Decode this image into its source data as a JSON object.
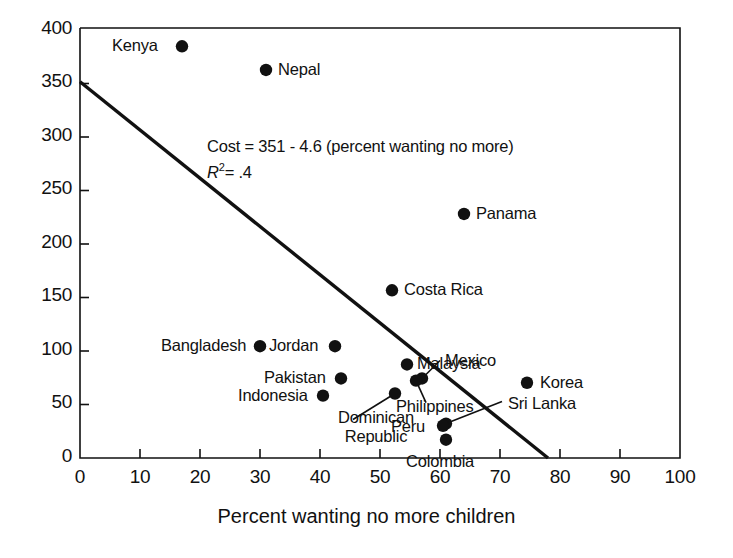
{
  "chart_data": {
    "type": "scatter",
    "title": "",
    "xlabel": "Percent wanting no more children",
    "ylabel": "",
    "xlim": [
      0,
      100
    ],
    "ylim": [
      0,
      400
    ],
    "xticks": [
      "0",
      "10",
      "20",
      "30",
      "40",
      "50",
      "60",
      "70",
      "80",
      "90",
      "100"
    ],
    "yticks": [
      "0",
      "50",
      "100",
      "150",
      "200",
      "250",
      "300",
      "350",
      "400"
    ],
    "grid": false,
    "legend": "none",
    "annotations": {
      "equation": "Cost = 351 - 4.6 (percent wanting no more)",
      "r_squared_prefix": "R",
      "r_squared_exponent": "2",
      "r_squared_value": "= .4"
    },
    "fit_line": {
      "intercept": 351,
      "slope": -4.6,
      "x_start": 0,
      "y_start": 350,
      "x_end": 78,
      "y_end": 0
    },
    "points": [
      {
        "name": "Kenya",
        "x": 17,
        "y": 383,
        "label_side": "left"
      },
      {
        "name": "Nepal",
        "x": 31,
        "y": 361,
        "label_side": "right"
      },
      {
        "name": "Panama",
        "x": 64,
        "y": 227,
        "label_side": "right"
      },
      {
        "name": "Costa Rica",
        "x": 52,
        "y": 156,
        "label_side": "right"
      },
      {
        "name": "Bangladesh",
        "x": 30,
        "y": 104,
        "label_side": "left"
      },
      {
        "name": "Jordan",
        "x": 42.5,
        "y": 104,
        "label_side": "left"
      },
      {
        "name": "Malaysia",
        "x": 54.5,
        "y": 87,
        "label_side": "right"
      },
      {
        "name": "Pakistan",
        "x": 43.5,
        "y": 74,
        "label_side": "left"
      },
      {
        "name": "Mexico",
        "x": 57,
        "y": 74,
        "label_side": "leader"
      },
      {
        "name": "Indonesia",
        "x": 40.5,
        "y": 58,
        "label_side": "left"
      },
      {
        "name": "Dominican Republic",
        "x": 52.5,
        "y": 60,
        "label_side": "leader"
      },
      {
        "name": "Philippines",
        "x": 56,
        "y": 72,
        "label_side": "leader"
      },
      {
        "name": "Sri Lanka",
        "x": 61,
        "y": 32,
        "label_side": "leader"
      },
      {
        "name": "Peru",
        "x": 60.5,
        "y": 30,
        "label_side": "left"
      },
      {
        "name": "Colombia",
        "x": 61,
        "y": 17,
        "label_side": "below"
      },
      {
        "name": "Korea",
        "x": 74.5,
        "y": 70,
        "label_side": "right"
      }
    ]
  }
}
